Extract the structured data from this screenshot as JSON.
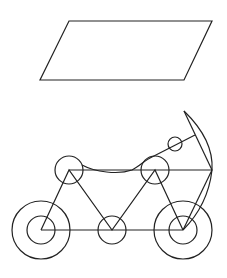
{
  "canvas": {
    "width": 227,
    "height": 278,
    "background": "#ffffff",
    "stroke": "#222222"
  },
  "figures": {
    "parallelogram": {
      "points": "69,21 212,21 184,80 40,80"
    },
    "bicycle": {
      "wheels": [
        {
          "name": "left-wheel",
          "cx": 41,
          "cy": 230,
          "r_outer": 29,
          "r_inner": 14
        },
        {
          "name": "right-wheel",
          "cx": 183,
          "cy": 230,
          "r_outer": 29,
          "r_inner": 14
        }
      ],
      "joints": [
        {
          "name": "top-left-joint",
          "cx": 69,
          "cy": 170,
          "r": 14
        },
        {
          "name": "top-right-joint",
          "cx": 155,
          "cy": 170,
          "r": 14
        },
        {
          "name": "bottom-middle-joint",
          "cx": 112,
          "cy": 230,
          "r": 14
        },
        {
          "name": "small-joint",
          "cx": 175,
          "cy": 144,
          "r": 7
        }
      ]
    }
  }
}
